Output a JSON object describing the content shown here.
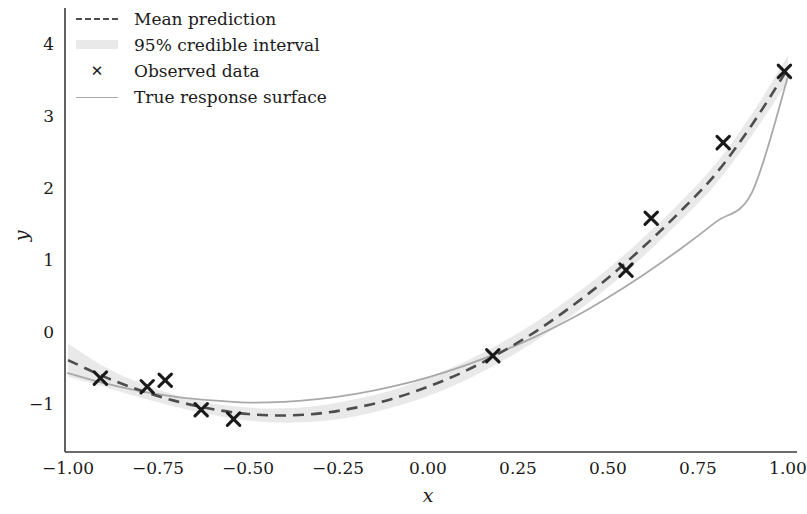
{
  "chart_data": {
    "type": "line",
    "title": "",
    "subtitle": "",
    "xlabel": "x",
    "ylabel": "y",
    "xlim": [
      -1.09,
      1.09
    ],
    "ylim": [
      -1.55,
      4.3
    ],
    "xticks": [
      -1.0,
      -0.75,
      -0.5,
      -0.25,
      0.0,
      0.25,
      0.5,
      0.75,
      1.0
    ],
    "xticklabels": [
      "−1.00",
      "−0.75",
      "−0.50",
      "−0.25",
      "0.00",
      "0.25",
      "0.50",
      "0.75",
      "1.00"
    ],
    "yticks": [
      -1,
      0,
      1,
      2,
      3,
      4
    ],
    "yticklabels": [
      "−1",
      "0",
      "1",
      "2",
      "3",
      "4"
    ],
    "grid": false,
    "legend_position": "upper left",
    "spines": [
      "left",
      "bottom"
    ],
    "series": [
      {
        "name": "Mean prediction",
        "type": "line",
        "style": "dashed",
        "color": "#4d4d4d",
        "x": [
          -1.0,
          -0.9,
          -0.8,
          -0.7,
          -0.6,
          -0.5,
          -0.4,
          -0.3,
          -0.2,
          -0.1,
          0.0,
          0.1,
          0.2,
          0.3,
          0.4,
          0.5,
          0.6,
          0.7,
          0.8,
          0.9,
          1.0
        ],
        "y": [
          -0.39,
          -0.62,
          -0.81,
          -0.96,
          -1.07,
          -1.14,
          -1.16,
          -1.13,
          -1.05,
          -0.93,
          -0.76,
          -0.55,
          -0.29,
          0.01,
          0.36,
          0.75,
          1.19,
          1.67,
          2.2,
          2.88,
          3.66
        ]
      },
      {
        "name": "True response surface",
        "type": "line",
        "style": "solid",
        "color": "#a9a9a9",
        "x": [
          -1.0,
          -0.9,
          -0.8,
          -0.7,
          -0.6,
          -0.5,
          -0.4,
          -0.3,
          -0.2,
          -0.1,
          0.0,
          0.1,
          0.2,
          0.3,
          0.4,
          0.5,
          0.6,
          0.7,
          0.8,
          0.9,
          1.0
        ],
        "y": [
          -0.57,
          -0.71,
          -0.82,
          -0.9,
          -0.95,
          -0.98,
          -0.97,
          -0.93,
          -0.86,
          -0.76,
          -0.63,
          -0.47,
          -0.28,
          -0.06,
          0.19,
          0.48,
          0.8,
          1.15,
          1.53,
          1.94,
          3.55
        ]
      },
      {
        "name": "95% credible interval",
        "type": "band",
        "color": "#e9e9e9",
        "x": [
          -1.0,
          -0.9,
          -0.8,
          -0.7,
          -0.6,
          -0.5,
          -0.4,
          -0.3,
          -0.2,
          -0.1,
          0.0,
          0.1,
          0.2,
          0.3,
          0.4,
          0.5,
          0.6,
          0.7,
          0.8,
          0.9,
          1.0
        ],
        "lower": [
          -0.62,
          -0.76,
          -0.91,
          -1.04,
          -1.15,
          -1.23,
          -1.26,
          -1.24,
          -1.17,
          -1.05,
          -0.89,
          -0.68,
          -0.42,
          -0.12,
          0.23,
          0.62,
          1.06,
          1.54,
          2.06,
          2.73,
          3.48
        ],
        "upper": [
          -0.16,
          -0.48,
          -0.71,
          -0.88,
          -0.99,
          -1.05,
          -1.06,
          -1.02,
          -0.93,
          -0.81,
          -0.63,
          -0.42,
          -0.16,
          0.14,
          0.49,
          0.88,
          1.32,
          1.8,
          2.34,
          3.03,
          3.84
        ]
      },
      {
        "name": "Observed data",
        "type": "scatter",
        "marker": "x",
        "color": "#1a1a1a",
        "x": [
          -0.91,
          -0.78,
          -0.73,
          -0.63,
          -0.54,
          0.18,
          0.55,
          0.62,
          0.82,
          0.99
        ],
        "y": [
          -0.64,
          -0.76,
          -0.67,
          -1.08,
          -1.21,
          -0.33,
          0.86,
          1.58,
          2.63,
          3.62
        ]
      }
    ]
  },
  "legend": {
    "entries": [
      {
        "label": "Mean prediction",
        "swatch": "dashed-line-swatch"
      },
      {
        "label": "95% credible interval",
        "swatch": "band-swatch"
      },
      {
        "label": "Observed data",
        "swatch": "x-marker-swatch"
      },
      {
        "label": "True response surface",
        "swatch": "solid-line-swatch"
      }
    ],
    "marker_glyph": "✕"
  },
  "colors": {
    "mean_line": "#4d4d4d",
    "true_line": "#a9a9a9",
    "band": "#e9e9e9",
    "marker": "#1a1a1a",
    "axis": "#3a3a3a",
    "text": "#1b1b1b",
    "background": "#ffffff"
  }
}
